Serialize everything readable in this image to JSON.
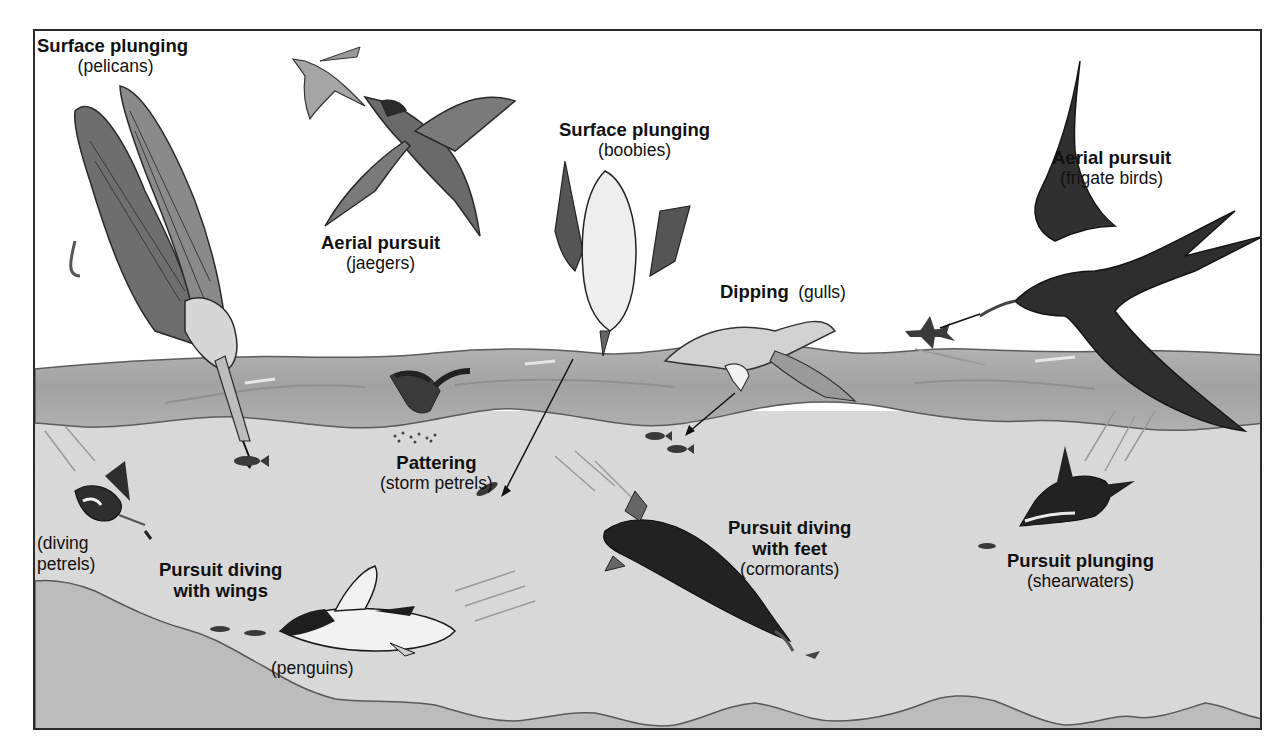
{
  "figure": {
    "colors": {
      "sky": "#ffffff",
      "wave_band": "#a9a9a9",
      "wave_highlight": "#c4c4c4",
      "underwater": "#dcdcdc",
      "seafloor": "#bdbdbd",
      "outline": "#4a4a4a",
      "bird_dark": "#2e2e2e",
      "bird_mid": "#7a7a7a",
      "text": "#111111"
    }
  },
  "labels": [
    {
      "id": "pelicans",
      "method": "Surface plunging",
      "group": "(pelicans)"
    },
    {
      "id": "jaegers",
      "method": "Aerial pursuit",
      "group": "(jaegers)"
    },
    {
      "id": "boobies",
      "method": "Surface plunging",
      "group": "(boobies)"
    },
    {
      "id": "frigate-birds",
      "method": "Aerial pursuit",
      "group": "(frigate birds)"
    },
    {
      "id": "gulls",
      "method": "Dipping",
      "group": "(gulls)"
    },
    {
      "id": "storm-petrels",
      "method": "Pattering",
      "group": "(storm petrels)"
    },
    {
      "id": "diving-petrels",
      "method": "",
      "group": "(diving\npetrels)",
      "group_line1": "(diving",
      "group_line2": "petrels)"
    },
    {
      "id": "penguins",
      "method": "Pursuit diving with wings",
      "method_line1": "Pursuit diving",
      "method_line2": "with wings",
      "group": "(penguins)"
    },
    {
      "id": "cormorants",
      "method": "Pursuit diving with feet",
      "method_line1": "Pursuit diving",
      "method_line2": "with feet",
      "group": "(cormorants)"
    },
    {
      "id": "shearwaters",
      "method": "Pursuit plunging",
      "group": "(shearwaters)"
    }
  ],
  "birds": [
    {
      "name": "pelican",
      "icon": "pelican-icon"
    },
    {
      "name": "tern",
      "icon": "tern-icon"
    },
    {
      "name": "jaeger",
      "icon": "jaeger-icon"
    },
    {
      "name": "booby",
      "icon": "booby-icon"
    },
    {
      "name": "frigate bird",
      "icon": "frigate-bird-icon"
    },
    {
      "name": "gull",
      "icon": "gull-icon"
    },
    {
      "name": "storm petrel",
      "icon": "storm-petrel-icon"
    },
    {
      "name": "diving petrel",
      "icon": "diving-petrel-icon"
    },
    {
      "name": "penguin",
      "icon": "penguin-icon"
    },
    {
      "name": "cormorant",
      "icon": "cormorant-icon"
    },
    {
      "name": "shearwater",
      "icon": "shearwater-icon"
    },
    {
      "name": "flying fish",
      "icon": "flying-fish-icon"
    }
  ]
}
